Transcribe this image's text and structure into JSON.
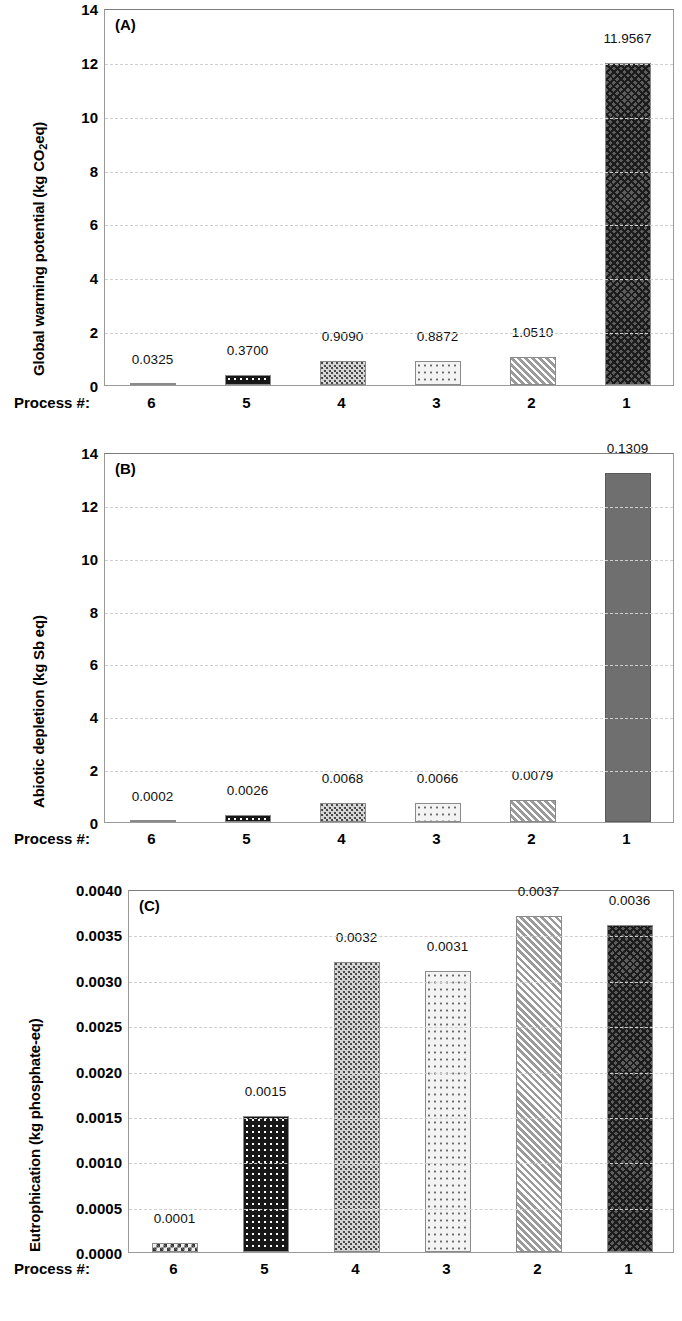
{
  "figure": {
    "x_axis_title": "Process #:",
    "categories": [
      "6",
      "5",
      "4",
      "3",
      "2",
      "1"
    ]
  },
  "chart_data": [
    {
      "type": "bar",
      "panel": "(A)",
      "title": "",
      "xlabel": "Process #:",
      "ylabel": "Global warming potential (kg CO2eq)",
      "ylabel_parts": {
        "pre": "Global warming potential (kg CO",
        "sub": "2",
        "post": "eq)"
      },
      "categories": [
        "6",
        "5",
        "4",
        "3",
        "2",
        "1"
      ],
      "values": [
        0.0325,
        0.37,
        0.909,
        0.8872,
        1.051,
        11.9567
      ],
      "value_labels": [
        "0.0325",
        "0.3700",
        "0.9090",
        "0.8872",
        "1.0510",
        "11.9567"
      ],
      "ylim": [
        0,
        14
      ],
      "yticks": [
        0,
        2,
        4,
        6,
        8,
        10,
        12,
        14
      ],
      "ytick_labels": [
        "0",
        "2",
        "4",
        "6",
        "8",
        "10",
        "12",
        "14"
      ],
      "grid": true,
      "legend": "none",
      "bar_patterns": [
        "checkerboard",
        "black-with-white-dots",
        "dense-speckle",
        "light-dotted",
        "diagonal-stripes",
        "dark-crosshatch"
      ]
    },
    {
      "type": "bar",
      "panel": "(B)",
      "title": "",
      "xlabel": "Process #:",
      "ylabel": "Abiotic depletion (kg Sb eq)",
      "categories": [
        "6",
        "5",
        "4",
        "3",
        "2",
        "1"
      ],
      "values": [
        0.0002,
        0.0026,
        0.0068,
        0.0066,
        0.0079,
        0.1309
      ],
      "value_labels": [
        "0.0002",
        "0.0026",
        "0.0068",
        "0.0066",
        "0.0079",
        "0.1309"
      ],
      "plotted_heights": [
        0.03,
        0.28,
        0.73,
        0.71,
        0.85,
        13.2
      ],
      "ylim": [
        0,
        14
      ],
      "yticks": [
        0,
        2,
        4,
        6,
        8,
        10,
        12,
        14
      ],
      "ytick_labels": [
        "0",
        "2",
        "4",
        "6",
        "8",
        "10",
        "12",
        "14"
      ],
      "grid": true,
      "legend": "none",
      "bar_patterns": [
        "checkerboard",
        "black-with-white-dots",
        "dense-speckle",
        "light-dotted",
        "diagonal-stripes",
        "solid-gray"
      ]
    },
    {
      "type": "bar",
      "panel": "(C)",
      "title": "",
      "xlabel": "Process #:",
      "ylabel": "Eutrophication (kg phosphate-eq)",
      "categories": [
        "6",
        "5",
        "4",
        "3",
        "2",
        "1"
      ],
      "values": [
        0.0001,
        0.0015,
        0.0032,
        0.0031,
        0.0037,
        0.0036
      ],
      "value_labels": [
        "0.0001",
        "0.0015",
        "0.0032",
        "0.0031",
        "0.0037",
        "0.0036"
      ],
      "ylim": [
        0,
        0.004
      ],
      "yticks": [
        0,
        0.0005,
        0.001,
        0.0015,
        0.002,
        0.0025,
        0.003,
        0.0035,
        0.004
      ],
      "ytick_labels": [
        "0.0000",
        "0.0005",
        "0.0010",
        "0.0015",
        "0.0020",
        "0.0025",
        "0.0030",
        "0.0035",
        "0.0040"
      ],
      "grid": true,
      "legend": "none",
      "bar_patterns": [
        "checkerboard",
        "black-with-white-dots",
        "dense-speckle",
        "light-dotted",
        "diagonal-stripes",
        "dark-crosshatch"
      ]
    }
  ]
}
